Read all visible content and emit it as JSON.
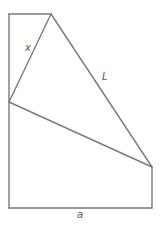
{
  "diagram": {
    "type": "folded-paper-geometry",
    "labels": {
      "fold_segment": "x",
      "crease": "L",
      "width": "a"
    },
    "colors": {
      "stroke": "#7a7a7a",
      "label": "#555555",
      "background": "#ffffff"
    },
    "vertices": {
      "top_left": [
        9,
        14
      ],
      "fold_top": [
        51,
        14
      ],
      "fold_left": [
        9,
        102
      ],
      "right_top": [
        152,
        167
      ],
      "bottom_left": [
        9,
        208
      ],
      "bottom_right": [
        152,
        208
      ]
    }
  }
}
